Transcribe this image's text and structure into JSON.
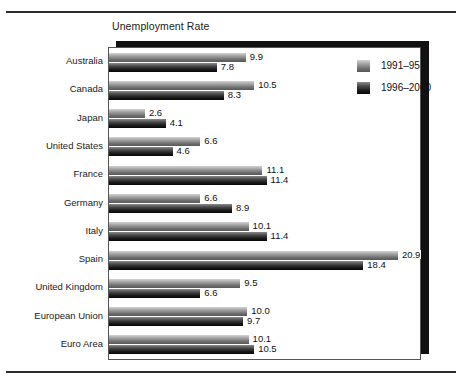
{
  "figure": {
    "title": "Unemployment Rate"
  },
  "legend": {
    "position": "top-right-inside-plot",
    "entries": [
      {
        "label": "1991–95",
        "swatch": "light-gradient-swatch"
      },
      {
        "label": "1996–2000",
        "swatch": "dark-gradient-swatch"
      }
    ]
  },
  "chart_data": {
    "type": "bar",
    "orientation": "horizontal",
    "title": "Unemployment Rate",
    "xlabel": "",
    "ylabel": "",
    "grid": false,
    "legend_position": "upper right",
    "xlim": [
      0,
      22.5
    ],
    "categories": [
      "Australia",
      "Canada",
      "Japan",
      "United States",
      "France",
      "Germany",
      "Italy",
      "Spain",
      "United Kingdom",
      "European Union",
      "Euro Area"
    ],
    "series": [
      {
        "name": "1991–95",
        "values": [
          9.9,
          10.5,
          2.6,
          6.6,
          11.1,
          6.6,
          10.1,
          20.9,
          9.5,
          10.0,
          10.1
        ],
        "labels": [
          "9.9",
          "10.5",
          "2.6",
          "6.6",
          "11.1",
          "6.6",
          "10.1",
          "20.9",
          "9.5",
          "10.0",
          "10.1"
        ]
      },
      {
        "name": "1996–2000",
        "values": [
          7.8,
          8.3,
          4.1,
          4.6,
          11.4,
          8.9,
          11.4,
          18.4,
          6.6,
          9.7,
          10.5
        ],
        "labels": [
          "7.8",
          "8.3",
          "4.1",
          "4.6",
          "11.4",
          "8.9",
          "11.4",
          "18.4",
          "6.6",
          "9.7",
          "10.5"
        ]
      }
    ]
  },
  "colors": {
    "series1_light": "#d3d3d3",
    "series1_dark": "#575757",
    "series2_light": "#8a8a8a",
    "series2_dark": "#070707",
    "rule": "#2b2b2b",
    "plot_border": "#555555",
    "plot_shadow": "#111111",
    "background": "#ffffff"
  }
}
